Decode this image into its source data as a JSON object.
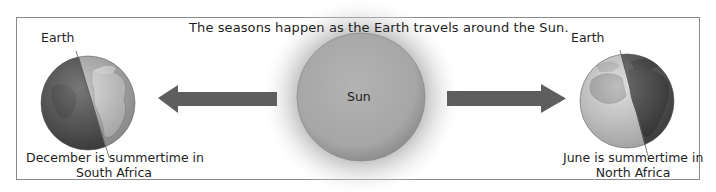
{
  "diagram": {
    "title": "The seasons happen as the Earth travels around the Sun.",
    "sun": {
      "label": "Sun",
      "color": "#a9a9a9"
    },
    "earth_left": {
      "label": "Earth",
      "caption_line1": "December is summertime in",
      "caption_line2": "South Africa",
      "lit_side": "right"
    },
    "earth_right": {
      "label": "Earth",
      "caption_line1": "June is summertime in",
      "caption_line2": "North Africa",
      "lit_side": "left"
    },
    "arrows": [
      {
        "direction": "left",
        "color": "#5e5e5e"
      },
      {
        "direction": "right",
        "color": "#5e5e5e"
      }
    ],
    "colors": {
      "frame_border": "#8a8a8a",
      "earth_dark": "#4a4a4a",
      "earth_light": "#b8b8b8",
      "land": "#cfcfcf"
    }
  }
}
